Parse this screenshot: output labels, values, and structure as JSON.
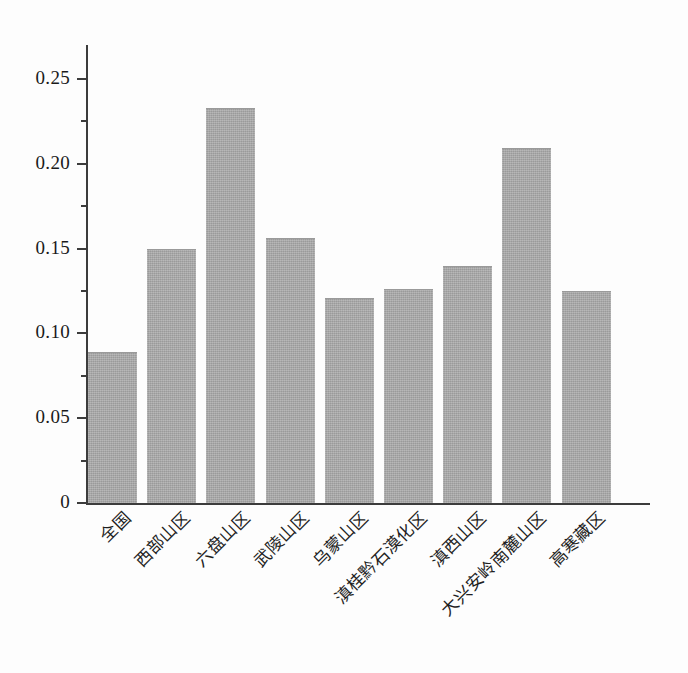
{
  "chart_data": {
    "type": "bar",
    "title": "",
    "subtitle": "",
    "xlabel": "",
    "ylabel": "",
    "ylim": [
      0,
      0.27
    ],
    "grid": false,
    "legend": "none",
    "bar_color": "#a9a9a9",
    "axis_color": "#3c3c3c",
    "categories": [
      "全国",
      "西部山区",
      "六盘山区",
      "武陵山区",
      "乌蒙山区",
      "滇桂黔石漠化区",
      "滇西山区",
      "大兴安岭南麓山区",
      "高寒藏区"
    ],
    "values": [
      0.089,
      0.15,
      0.233,
      0.156,
      0.121,
      0.126,
      0.14,
      0.209,
      0.125
    ],
    "y_ticks_major": [
      0,
      0.05,
      0.1,
      0.15,
      0.2,
      0.25
    ],
    "y_ticks_major_labels": [
      "0",
      "0.05",
      "0.10",
      "0.15",
      "0.20",
      "0.25"
    ],
    "y_ticks_minor": [
      0.025,
      0.075,
      0.125,
      0.175,
      0.225
    ]
  }
}
